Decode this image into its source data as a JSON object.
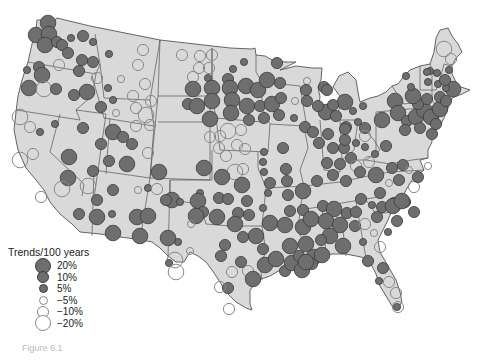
{
  "figure": {
    "caption": "Figure 6.1"
  },
  "colors": {
    "land": "#d9d9d9",
    "border": "#555555",
    "increase_fill": "#6e6e6e",
    "increase_stroke": "#3c3c3c",
    "decrease_stroke": "#8a8a8a",
    "background": "#ffffff"
  },
  "legend": {
    "title": "Trends/100 years",
    "items": [
      {
        "label": "20%",
        "type": "increase",
        "size": 16
      },
      {
        "label": "10%",
        "type": "increase",
        "size": 12
      },
      {
        "label": "5%",
        "type": "increase",
        "size": 9
      },
      {
        "label": "−5%",
        "type": "decrease",
        "size": 9
      },
      {
        "label": "−10%",
        "type": "decrease",
        "size": 12
      },
      {
        "label": "−20%",
        "type": "decrease",
        "size": 16
      }
    ]
  },
  "stations": [
    {
      "x": 48,
      "y": 23,
      "v": 20
    },
    {
      "x": 36,
      "y": 35,
      "v": 20
    },
    {
      "x": 49,
      "y": 34,
      "v": 20
    },
    {
      "x": 45,
      "y": 45,
      "v": 20
    },
    {
      "x": 57,
      "y": 42,
      "v": 10
    },
    {
      "x": 62,
      "y": 45,
      "v": 10
    },
    {
      "x": 71,
      "y": 38,
      "v": 5
    },
    {
      "x": 83,
      "y": 36,
      "v": 10
    },
    {
      "x": 68,
      "y": 53,
      "v": 10
    },
    {
      "x": 93,
      "y": 42,
      "v": 5
    },
    {
      "x": 143,
      "y": 50,
      "v": -10
    },
    {
      "x": 109,
      "y": 54,
      "v": 5
    },
    {
      "x": 82,
      "y": 60,
      "v": 10
    },
    {
      "x": 93,
      "y": 62,
      "v": 10
    },
    {
      "x": 39,
      "y": 67,
      "v": 10
    },
    {
      "x": 42,
      "y": 75,
      "v": 20
    },
    {
      "x": 27,
      "y": 70,
      "v": 5
    },
    {
      "x": 59,
      "y": 65,
      "v": -10
    },
    {
      "x": 79,
      "y": 71,
      "v": 10
    },
    {
      "x": 97,
      "y": 78,
      "v": -10
    },
    {
      "x": 138,
      "y": 65,
      "v": -10
    },
    {
      "x": 108,
      "y": 88,
      "v": 5
    },
    {
      "x": 121,
      "y": 79,
      "v": -5
    },
    {
      "x": 145,
      "y": 84,
      "v": -10
    },
    {
      "x": 29,
      "y": 88,
      "v": 20
    },
    {
      "x": 44,
      "y": 89,
      "v": -20
    },
    {
      "x": 56,
      "y": 89,
      "v": 10
    },
    {
      "x": 74,
      "y": 95,
      "v": 10
    },
    {
      "x": 87,
      "y": 92,
      "v": 20
    },
    {
      "x": 101,
      "y": 107,
      "v": 10
    },
    {
      "x": 113,
      "y": 100,
      "v": 5
    },
    {
      "x": 116,
      "y": 113,
      "v": -5
    },
    {
      "x": 133,
      "y": 96,
      "v": -10
    },
    {
      "x": 151,
      "y": 101,
      "v": -10
    },
    {
      "x": 136,
      "y": 108,
      "v": -10
    },
    {
      "x": 146,
      "y": 115,
      "v": -20
    },
    {
      "x": 20,
      "y": 117,
      "v": -20
    },
    {
      "x": 30,
      "y": 127,
      "v": -10
    },
    {
      "x": 40,
      "y": 132,
      "v": 5
    },
    {
      "x": 55,
      "y": 124,
      "v": 5
    },
    {
      "x": 83,
      "y": 128,
      "v": 10
    },
    {
      "x": 113,
      "y": 132,
      "v": 20
    },
    {
      "x": 123,
      "y": 137,
      "v": 10
    },
    {
      "x": 132,
      "y": 144,
      "v": 10
    },
    {
      "x": 136,
      "y": 126,
      "v": -10
    },
    {
      "x": 150,
      "y": 125,
      "v": -10
    },
    {
      "x": 20,
      "y": 160,
      "v": -20
    },
    {
      "x": 33,
      "y": 154,
      "v": -10
    },
    {
      "x": 69,
      "y": 157,
      "v": 20
    },
    {
      "x": 101,
      "y": 144,
      "v": 10
    },
    {
      "x": 109,
      "y": 161,
      "v": 10
    },
    {
      "x": 127,
      "y": 164,
      "v": 20
    },
    {
      "x": 148,
      "y": 153,
      "v": -10
    },
    {
      "x": 68,
      "y": 178,
      "v": 20
    },
    {
      "x": 93,
      "y": 171,
      "v": 10
    },
    {
      "x": 138,
      "y": 190,
      "v": -5
    },
    {
      "x": 148,
      "y": 188,
      "v": 5
    },
    {
      "x": 62,
      "y": 189,
      "v": -20
    },
    {
      "x": 88,
      "y": 186,
      "v": -20
    },
    {
      "x": 41,
      "y": 197,
      "v": -10
    },
    {
      "x": 97,
      "y": 200,
      "v": 10
    },
    {
      "x": 113,
      "y": 190,
      "v": 10
    },
    {
      "x": 79,
      "y": 214,
      "v": 10
    },
    {
      "x": 97,
      "y": 217,
      "v": 20
    },
    {
      "x": 112,
      "y": 214,
      "v": 5
    },
    {
      "x": 137,
      "y": 217,
      "v": 20
    },
    {
      "x": 148,
      "y": 216,
      "v": 20
    },
    {
      "x": 113,
      "y": 233,
      "v": 20
    },
    {
      "x": 140,
      "y": 236,
      "v": 20
    },
    {
      "x": 182,
      "y": 55,
      "v": -10
    },
    {
      "x": 200,
      "y": 56,
      "v": -10
    },
    {
      "x": 212,
      "y": 55,
      "v": -10
    },
    {
      "x": 199,
      "y": 68,
      "v": -10
    },
    {
      "x": 209,
      "y": 68,
      "v": -10
    },
    {
      "x": 193,
      "y": 77,
      "v": -10
    },
    {
      "x": 208,
      "y": 78,
      "v": 5
    },
    {
      "x": 233,
      "y": 69,
      "v": 5
    },
    {
      "x": 244,
      "y": 62,
      "v": 5
    },
    {
      "x": 277,
      "y": 63,
      "v": 10
    },
    {
      "x": 193,
      "y": 89,
      "v": 20
    },
    {
      "x": 212,
      "y": 88,
      "v": 20
    },
    {
      "x": 228,
      "y": 79,
      "v": 10
    },
    {
      "x": 230,
      "y": 88,
      "v": 20
    },
    {
      "x": 246,
      "y": 86,
      "v": 20
    },
    {
      "x": 258,
      "y": 90,
      "v": 20
    },
    {
      "x": 267,
      "y": 80,
      "v": 20
    },
    {
      "x": 280,
      "y": 83,
      "v": 10
    },
    {
      "x": 307,
      "y": 81,
      "v": -5
    },
    {
      "x": 306,
      "y": 90,
      "v": 10
    },
    {
      "x": 188,
      "y": 104,
      "v": 10
    },
    {
      "x": 197,
      "y": 106,
      "v": 20
    },
    {
      "x": 212,
      "y": 101,
      "v": 20
    },
    {
      "x": 232,
      "y": 100,
      "v": 20
    },
    {
      "x": 247,
      "y": 106,
      "v": 20
    },
    {
      "x": 260,
      "y": 106,
      "v": 10
    },
    {
      "x": 272,
      "y": 104,
      "v": 20
    },
    {
      "x": 281,
      "y": 98,
      "v": 10
    },
    {
      "x": 295,
      "y": 101,
      "v": -5
    },
    {
      "x": 307,
      "y": 101,
      "v": 10
    },
    {
      "x": 210,
      "y": 119,
      "v": 20
    },
    {
      "x": 231,
      "y": 113,
      "v": 20
    },
    {
      "x": 249,
      "y": 120,
      "v": 10
    },
    {
      "x": 264,
      "y": 118,
      "v": 10
    },
    {
      "x": 279,
      "y": 115,
      "v": 10
    },
    {
      "x": 294,
      "y": 118,
      "v": 5
    },
    {
      "x": 305,
      "y": 127,
      "v": 10
    },
    {
      "x": 324,
      "y": 87,
      "v": 10
    },
    {
      "x": 326,
      "y": 112,
      "v": 20
    },
    {
      "x": 345,
      "y": 102,
      "v": 20
    },
    {
      "x": 210,
      "y": 137,
      "v": -10
    },
    {
      "x": 220,
      "y": 136,
      "v": -10
    },
    {
      "x": 228,
      "y": 131,
      "v": -20
    },
    {
      "x": 241,
      "y": 130,
      "v": -10
    },
    {
      "x": 219,
      "y": 148,
      "v": -10
    },
    {
      "x": 237,
      "y": 145,
      "v": -10
    },
    {
      "x": 226,
      "y": 156,
      "v": -10
    },
    {
      "x": 245,
      "y": 149,
      "v": -10
    },
    {
      "x": 235,
      "y": 172,
      "v": -20
    },
    {
      "x": 243,
      "y": 169,
      "v": -10
    },
    {
      "x": 264,
      "y": 152,
      "v": 5
    },
    {
      "x": 283,
      "y": 148,
      "v": 10
    },
    {
      "x": 263,
      "y": 162,
      "v": 5
    },
    {
      "x": 264,
      "y": 172,
      "v": 5
    },
    {
      "x": 286,
      "y": 169,
      "v": 10
    },
    {
      "x": 313,
      "y": 132,
      "v": 10
    },
    {
      "x": 328,
      "y": 134,
      "v": 10
    },
    {
      "x": 346,
      "y": 127,
      "v": 10
    },
    {
      "x": 365,
      "y": 128,
      "v": 10
    },
    {
      "x": 159,
      "y": 172,
      "v": 20
    },
    {
      "x": 157,
      "y": 189,
      "v": -10
    },
    {
      "x": 204,
      "y": 168,
      "v": 20
    },
    {
      "x": 222,
      "y": 177,
      "v": 20
    },
    {
      "x": 242,
      "y": 185,
      "v": 20
    },
    {
      "x": 270,
      "y": 183,
      "v": 10
    },
    {
      "x": 287,
      "y": 181,
      "v": 10
    },
    {
      "x": 303,
      "y": 191,
      "v": 20
    },
    {
      "x": 268,
      "y": 193,
      "v": 5
    },
    {
      "x": 288,
      "y": 195,
      "v": 10
    },
    {
      "x": 200,
      "y": 193,
      "v": 5
    },
    {
      "x": 219,
      "y": 198,
      "v": 10
    },
    {
      "x": 247,
      "y": 201,
      "v": 10
    },
    {
      "x": 263,
      "y": 208,
      "v": 5
    },
    {
      "x": 290,
      "y": 211,
      "v": 10
    },
    {
      "x": 249,
      "y": 215,
      "v": 10
    },
    {
      "x": 270,
      "y": 223,
      "v": 20
    },
    {
      "x": 285,
      "y": 225,
      "v": 20
    },
    {
      "x": 303,
      "y": 210,
      "v": 10
    },
    {
      "x": 303,
      "y": 227,
      "v": 20
    },
    {
      "x": 172,
      "y": 200,
      "v": 20
    },
    {
      "x": 180,
      "y": 202,
      "v": 5
    },
    {
      "x": 198,
      "y": 201,
      "v": 20
    },
    {
      "x": 166,
      "y": 200,
      "v": 10
    },
    {
      "x": 203,
      "y": 212,
      "v": 10
    },
    {
      "x": 228,
      "y": 199,
      "v": 10
    },
    {
      "x": 238,
      "y": 213,
      "v": 10
    },
    {
      "x": 196,
      "y": 216,
      "v": 20
    },
    {
      "x": 217,
      "y": 217,
      "v": 20
    },
    {
      "x": 235,
      "y": 224,
      "v": 20
    },
    {
      "x": 191,
      "y": 224,
      "v": -5
    },
    {
      "x": 178,
      "y": 242,
      "v": 5
    },
    {
      "x": 168,
      "y": 238,
      "v": 20
    },
    {
      "x": 190,
      "y": 251,
      "v": -5
    },
    {
      "x": 175,
      "y": 260,
      "v": -20
    },
    {
      "x": 169,
      "y": 263,
      "v": 5
    },
    {
      "x": 225,
      "y": 245,
      "v": 10
    },
    {
      "x": 243,
      "y": 237,
      "v": 10
    },
    {
      "x": 256,
      "y": 236,
      "v": 20
    },
    {
      "x": 263,
      "y": 249,
      "v": 10
    },
    {
      "x": 176,
      "y": 272,
      "v": -20
    },
    {
      "x": 232,
      "y": 272,
      "v": -10
    },
    {
      "x": 248,
      "y": 271,
      "v": -10
    },
    {
      "x": 228,
      "y": 288,
      "v": 10
    },
    {
      "x": 221,
      "y": 256,
      "v": 10
    },
    {
      "x": 241,
      "y": 262,
      "v": 10
    },
    {
      "x": 220,
      "y": 287,
      "v": -10
    },
    {
      "x": 229,
      "y": 309,
      "v": -10
    },
    {
      "x": 253,
      "y": 279,
      "v": 20
    },
    {
      "x": 265,
      "y": 265,
      "v": 20
    },
    {
      "x": 276,
      "y": 259,
      "v": 20
    },
    {
      "x": 290,
      "y": 246,
      "v": 20
    },
    {
      "x": 285,
      "y": 271,
      "v": 10
    },
    {
      "x": 292,
      "y": 263,
      "v": 20
    },
    {
      "x": 299,
      "y": 256,
      "v": 10
    },
    {
      "x": 306,
      "y": 244,
      "v": 20
    },
    {
      "x": 314,
      "y": 257,
      "v": 20
    },
    {
      "x": 322,
      "y": 255,
      "v": 20
    },
    {
      "x": 302,
      "y": 270,
      "v": 20
    },
    {
      "x": 312,
      "y": 264,
      "v": 10
    },
    {
      "x": 319,
      "y": 143,
      "v": 10
    },
    {
      "x": 333,
      "y": 148,
      "v": 10
    },
    {
      "x": 344,
      "y": 148,
      "v": 10
    },
    {
      "x": 356,
      "y": 143,
      "v": 5
    },
    {
      "x": 365,
      "y": 147,
      "v": 5
    },
    {
      "x": 365,
      "y": 136,
      "v": -10
    },
    {
      "x": 351,
      "y": 158,
      "v": 10
    },
    {
      "x": 327,
      "y": 163,
      "v": 10
    },
    {
      "x": 340,
      "y": 164,
      "v": 10
    },
    {
      "x": 356,
      "y": 166,
      "v": -10
    },
    {
      "x": 317,
      "y": 181,
      "v": 10
    },
    {
      "x": 333,
      "y": 175,
      "v": 10
    },
    {
      "x": 346,
      "y": 181,
      "v": 10
    },
    {
      "x": 360,
      "y": 172,
      "v": 10
    },
    {
      "x": 375,
      "y": 154,
      "v": 5
    },
    {
      "x": 386,
      "y": 146,
      "v": 10
    },
    {
      "x": 369,
      "y": 162,
      "v": -10
    },
    {
      "x": 376,
      "y": 175,
      "v": 20
    },
    {
      "x": 392,
      "y": 168,
      "v": 10
    },
    {
      "x": 403,
      "y": 165,
      "v": 10
    },
    {
      "x": 361,
      "y": 199,
      "v": 10
    },
    {
      "x": 380,
      "y": 193,
      "v": 10
    },
    {
      "x": 389,
      "y": 183,
      "v": -5
    },
    {
      "x": 399,
      "y": 180,
      "v": 10
    },
    {
      "x": 409,
      "y": 170,
      "v": -5
    },
    {
      "x": 414,
      "y": 187,
      "v": -10
    },
    {
      "x": 418,
      "y": 177,
      "v": 10
    },
    {
      "x": 428,
      "y": 166,
      "v": -5
    },
    {
      "x": 394,
      "y": 203,
      "v": 10
    },
    {
      "x": 405,
      "y": 202,
      "v": 10
    },
    {
      "x": 323,
      "y": 206,
      "v": 10
    },
    {
      "x": 334,
      "y": 209,
      "v": 20
    },
    {
      "x": 347,
      "y": 213,
      "v": 10
    },
    {
      "x": 356,
      "y": 212,
      "v": 10
    },
    {
      "x": 372,
      "y": 205,
      "v": 5
    },
    {
      "x": 382,
      "y": 207,
      "v": 10
    },
    {
      "x": 393,
      "y": 206,
      "v": 20
    },
    {
      "x": 397,
      "y": 221,
      "v": 10
    },
    {
      "x": 414,
      "y": 212,
      "v": 10
    },
    {
      "x": 402,
      "y": 201,
      "v": 20
    },
    {
      "x": 311,
      "y": 219,
      "v": 20
    },
    {
      "x": 326,
      "y": 221,
      "v": 20
    },
    {
      "x": 340,
      "y": 225,
      "v": 20
    },
    {
      "x": 330,
      "y": 236,
      "v": 20
    },
    {
      "x": 343,
      "y": 246,
      "v": 20
    },
    {
      "x": 355,
      "y": 226,
      "v": 10
    },
    {
      "x": 365,
      "y": 224,
      "v": -10
    },
    {
      "x": 374,
      "y": 233,
      "v": -5
    },
    {
      "x": 380,
      "y": 247,
      "v": -10
    },
    {
      "x": 377,
      "y": 217,
      "v": 10
    },
    {
      "x": 321,
      "y": 240,
      "v": 10
    },
    {
      "x": 306,
      "y": 262,
      "v": 20
    },
    {
      "x": 363,
      "y": 242,
      "v": 5
    },
    {
      "x": 388,
      "y": 232,
      "v": 5
    },
    {
      "x": 368,
      "y": 261,
      "v": 10
    },
    {
      "x": 383,
      "y": 268,
      "v": 10
    },
    {
      "x": 389,
      "y": 282,
      "v": -10
    },
    {
      "x": 396,
      "y": 293,
      "v": -10
    },
    {
      "x": 379,
      "y": 281,
      "v": 5
    },
    {
      "x": 398,
      "y": 307,
      "v": -10
    },
    {
      "x": 397,
      "y": 307,
      "v": 5
    },
    {
      "x": 345,
      "y": 140,
      "v": 10
    },
    {
      "x": 327,
      "y": 90,
      "v": 10
    },
    {
      "x": 333,
      "y": 105,
      "v": 10
    },
    {
      "x": 336,
      "y": 116,
      "v": 10
    },
    {
      "x": 318,
      "y": 106,
      "v": 10
    },
    {
      "x": 345,
      "y": 129,
      "v": 10
    },
    {
      "x": 353,
      "y": 111,
      "v": 5
    },
    {
      "x": 358,
      "y": 122,
      "v": 5
    },
    {
      "x": 363,
      "y": 106,
      "v": 5
    },
    {
      "x": 382,
      "y": 120,
      "v": 20
    },
    {
      "x": 395,
      "y": 101,
      "v": 20
    },
    {
      "x": 398,
      "y": 113,
      "v": 20
    },
    {
      "x": 407,
      "y": 121,
      "v": 10
    },
    {
      "x": 416,
      "y": 117,
      "v": 20
    },
    {
      "x": 424,
      "y": 110,
      "v": 20
    },
    {
      "x": 431,
      "y": 117,
      "v": 20
    },
    {
      "x": 418,
      "y": 104,
      "v": 10
    },
    {
      "x": 413,
      "y": 96,
      "v": 20
    },
    {
      "x": 427,
      "y": 99,
      "v": 10
    },
    {
      "x": 405,
      "y": 130,
      "v": 10
    },
    {
      "x": 420,
      "y": 128,
      "v": 10
    },
    {
      "x": 432,
      "y": 134,
      "v": 10
    },
    {
      "x": 436,
      "y": 124,
      "v": 10
    },
    {
      "x": 440,
      "y": 109,
      "v": 20
    },
    {
      "x": 440,
      "y": 97,
      "v": 10
    },
    {
      "x": 446,
      "y": 101,
      "v": 10
    },
    {
      "x": 453,
      "y": 89,
      "v": 20
    },
    {
      "x": 446,
      "y": 88,
      "v": 5
    },
    {
      "x": 438,
      "y": 84,
      "v": 5
    },
    {
      "x": 428,
      "y": 82,
      "v": 5
    },
    {
      "x": 406,
      "y": 76,
      "v": 5
    },
    {
      "x": 411,
      "y": 87,
      "v": 5
    },
    {
      "x": 430,
      "y": 71,
      "v": 5
    },
    {
      "x": 437,
      "y": 73,
      "v": 5
    },
    {
      "x": 445,
      "y": 80,
      "v": 10
    },
    {
      "x": 444,
      "y": 49,
      "v": -20
    },
    {
      "x": 451,
      "y": 59,
      "v": -10
    },
    {
      "x": 427,
      "y": 72,
      "v": 5
    },
    {
      "x": 449,
      "y": 70,
      "v": 5
    }
  ]
}
